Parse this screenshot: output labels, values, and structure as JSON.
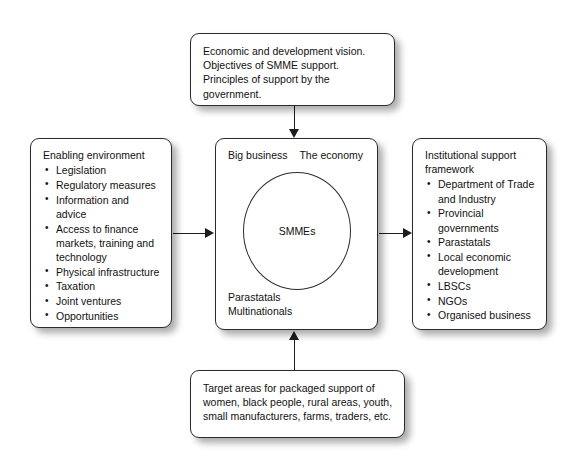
{
  "diagram": {
    "background_color": "#ffffff",
    "line_color": "#1d1d1d",
    "box_border_color": "#2b2b2b",
    "text_color": "#111111"
  },
  "nodes": {
    "top": {
      "text": "Economic and development vision. Objectives of SMME support. Principles of support by the government."
    },
    "left": {
      "heading": "Enabling environment",
      "items": [
        "Legislation",
        "Regulatory measures",
        "Information and advice",
        "Access to finance markets, training and technology",
        "Physical infrastructure",
        "Taxation",
        "Joint ventures",
        "Opportunities"
      ]
    },
    "center": {
      "top_left_label": "Big business",
      "top_right_label": "The economy",
      "circle_label": "SMMEs",
      "bottom_label_1": "Parastatals",
      "bottom_label_2": "Multinationals"
    },
    "right": {
      "heading": "Institutional support framework",
      "items": [
        "Department of Trade and Industry",
        "Provincial governments",
        "Parastatals",
        "Local economic development",
        "LBSCs",
        "NGOs",
        "Organised business"
      ]
    },
    "bottom": {
      "text": "Target areas for packaged support of women, black people, rural areas, youth, small manufacturers, farms, traders, etc."
    }
  },
  "connectors": [
    {
      "name": "top-to-center",
      "direction": "down"
    },
    {
      "name": "left-to-center",
      "direction": "right"
    },
    {
      "name": "center-to-right",
      "direction": "right"
    },
    {
      "name": "bottom-to-center",
      "direction": "up"
    }
  ]
}
